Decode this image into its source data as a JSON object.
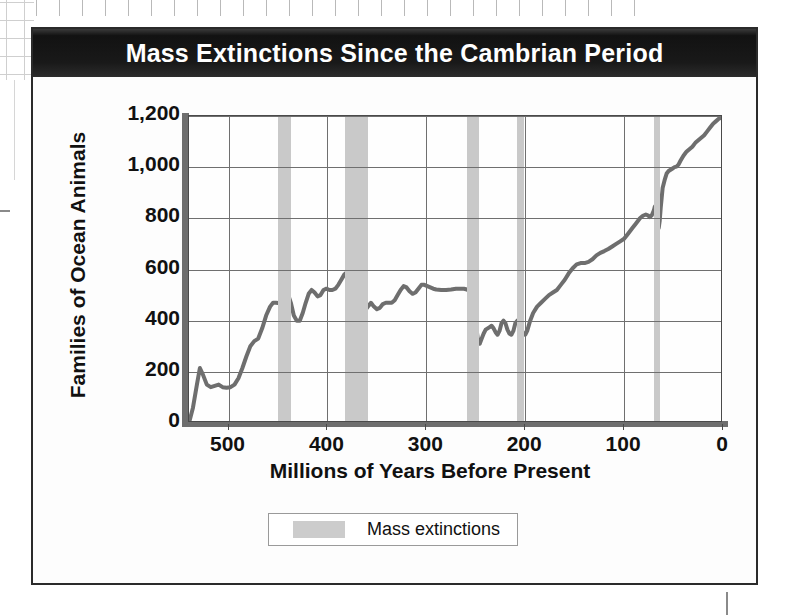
{
  "chart_data": {
    "type": "line",
    "title": "Mass Extinctions Since the Cambrian Period",
    "xlabel": "Millions of Years Before Present",
    "ylabel": "Families of Ocean Animals",
    "xlim": [
      540,
      0
    ],
    "ylim": [
      0,
      1200
    ],
    "x_reversed": true,
    "grid": true,
    "x_ticks": [
      "500",
      "400",
      "300",
      "200",
      "100",
      "0"
    ],
    "x_tick_values": [
      500,
      400,
      300,
      200,
      100,
      0
    ],
    "y_ticks": [
      "0",
      "200",
      "400",
      "600",
      "800",
      "1,000",
      "1,200"
    ],
    "y_tick_values": [
      0,
      200,
      400,
      600,
      800,
      1000,
      1200
    ],
    "legend": {
      "position": "bottom",
      "entries": [
        {
          "label": "Mass extinctions",
          "color": "#cccccc",
          "marker": "band"
        }
      ]
    },
    "series": [
      {
        "name": "Families of Ocean Animals",
        "color": "#6e6e6e",
        "points": [
          [
            540,
            0
          ],
          [
            536,
            60
          ],
          [
            532,
            150
          ],
          [
            529,
            215
          ],
          [
            526,
            190
          ],
          [
            522,
            150
          ],
          [
            518,
            140
          ],
          [
            514,
            145
          ],
          [
            510,
            150
          ],
          [
            506,
            140
          ],
          [
            502,
            138
          ],
          [
            498,
            140
          ],
          [
            494,
            150
          ],
          [
            490,
            175
          ],
          [
            486,
            215
          ],
          [
            482,
            260
          ],
          [
            478,
            300
          ],
          [
            474,
            320
          ],
          [
            470,
            330
          ],
          [
            466,
            370
          ],
          [
            462,
            420
          ],
          [
            458,
            455
          ],
          [
            455,
            470
          ],
          [
            452,
            470
          ],
          [
            448,
            468
          ],
          [
            445,
            472
          ],
          [
            442,
            500
          ],
          [
            440,
            505
          ],
          [
            437,
            470
          ],
          [
            434,
            420
          ],
          [
            431,
            400
          ],
          [
            428,
            400
          ],
          [
            425,
            430
          ],
          [
            422,
            470
          ],
          [
            419,
            505
          ],
          [
            416,
            520
          ],
          [
            413,
            510
          ],
          [
            410,
            495
          ],
          [
            407,
            500
          ],
          [
            404,
            520
          ],
          [
            401,
            525
          ],
          [
            398,
            520
          ],
          [
            395,
            520
          ],
          [
            392,
            525
          ],
          [
            389,
            540
          ],
          [
            386,
            560
          ],
          [
            383,
            580
          ],
          [
            380,
            590
          ],
          [
            377,
            585
          ],
          [
            374,
            560
          ],
          [
            371,
            520
          ],
          [
            368,
            490
          ],
          [
            365,
            470
          ],
          [
            362,
            440
          ],
          [
            359,
            455
          ],
          [
            356,
            470
          ],
          [
            353,
            455
          ],
          [
            350,
            445
          ],
          [
            347,
            450
          ],
          [
            344,
            465
          ],
          [
            341,
            470
          ],
          [
            338,
            470
          ],
          [
            335,
            470
          ],
          [
            332,
            480
          ],
          [
            329,
            500
          ],
          [
            326,
            520
          ],
          [
            323,
            535
          ],
          [
            320,
            530
          ],
          [
            317,
            515
          ],
          [
            314,
            505
          ],
          [
            311,
            510
          ],
          [
            308,
            525
          ],
          [
            305,
            540
          ],
          [
            302,
            540
          ],
          [
            299,
            535
          ],
          [
            296,
            530
          ],
          [
            293,
            525
          ],
          [
            290,
            522
          ],
          [
            285,
            520
          ],
          [
            280,
            520
          ],
          [
            275,
            522
          ],
          [
            270,
            525
          ],
          [
            265,
            525
          ],
          [
            262,
            525
          ],
          [
            259,
            522
          ],
          [
            256,
            515
          ],
          [
            254,
            500
          ],
          [
            252,
            470
          ],
          [
            251,
            430
          ],
          [
            250,
            395
          ],
          [
            249,
            360
          ],
          [
            248,
            330
          ],
          [
            247,
            315
          ],
          [
            246,
            310
          ],
          [
            244,
            330
          ],
          [
            242,
            350
          ],
          [
            240,
            365
          ],
          [
            238,
            370
          ],
          [
            236,
            375
          ],
          [
            234,
            380
          ],
          [
            232,
            370
          ],
          [
            230,
            355
          ],
          [
            228,
            345
          ],
          [
            226,
            360
          ],
          [
            224,
            390
          ],
          [
            222,
            400
          ],
          [
            220,
            390
          ],
          [
            218,
            365
          ],
          [
            216,
            350
          ],
          [
            214,
            345
          ],
          [
            212,
            360
          ],
          [
            210,
            390
          ],
          [
            208,
            400
          ],
          [
            206,
            395
          ],
          [
            204,
            370
          ],
          [
            202,
            350
          ],
          [
            200,
            345
          ],
          [
            198,
            360
          ],
          [
            195,
            400
          ],
          [
            192,
            430
          ],
          [
            188,
            455
          ],
          [
            184,
            470
          ],
          [
            180,
            485
          ],
          [
            176,
            500
          ],
          [
            172,
            510
          ],
          [
            168,
            520
          ],
          [
            164,
            540
          ],
          [
            160,
            560
          ],
          [
            156,
            585
          ],
          [
            152,
            605
          ],
          [
            148,
            620
          ],
          [
            144,
            625
          ],
          [
            140,
            625
          ],
          [
            136,
            630
          ],
          [
            132,
            640
          ],
          [
            128,
            655
          ],
          [
            124,
            665
          ],
          [
            120,
            672
          ],
          [
            116,
            680
          ],
          [
            112,
            690
          ],
          [
            108,
            700
          ],
          [
            104,
            710
          ],
          [
            100,
            720
          ],
          [
            96,
            740
          ],
          [
            92,
            760
          ],
          [
            88,
            780
          ],
          [
            84,
            800
          ],
          [
            81,
            810
          ],
          [
            78,
            815
          ],
          [
            76,
            812
          ],
          [
            74,
            805
          ],
          [
            72,
            812
          ],
          [
            70,
            830
          ],
          [
            69,
            845
          ],
          [
            68,
            850
          ],
          [
            67,
            830
          ],
          [
            66,
            790
          ],
          [
            65,
            762
          ],
          [
            64,
            790
          ],
          [
            63,
            840
          ],
          [
            62,
            880
          ],
          [
            61,
            920
          ],
          [
            59,
            950
          ],
          [
            57,
            975
          ],
          [
            55,
            985
          ],
          [
            53,
            990
          ],
          [
            51,
            995
          ],
          [
            49,
            1000
          ],
          [
            47,
            1002
          ],
          [
            45,
            1010
          ],
          [
            43,
            1025
          ],
          [
            40,
            1045
          ],
          [
            37,
            1060
          ],
          [
            34,
            1070
          ],
          [
            31,
            1080
          ],
          [
            28,
            1095
          ],
          [
            25,
            1105
          ],
          [
            22,
            1115
          ],
          [
            19,
            1125
          ],
          [
            16,
            1140
          ],
          [
            13,
            1155
          ],
          [
            10,
            1170
          ],
          [
            7,
            1180
          ],
          [
            4,
            1190
          ],
          [
            0,
            1195
          ]
        ]
      }
    ],
    "bands": [
      {
        "name": "End-Ordovician",
        "from": 450,
        "to": 437,
        "color": "#c9c9c9"
      },
      {
        "name": "Late Devonian",
        "from": 382,
        "to": 359,
        "color": "#c9c9c9"
      },
      {
        "name": "End-Permian",
        "from": 259,
        "to": 247,
        "color": "#c9c9c9"
      },
      {
        "name": "End-Triassic",
        "from": 208,
        "to": 201,
        "color": "#c9c9c9"
      },
      {
        "name": "End-Cretaceous",
        "from": 70,
        "to": 64,
        "color": "#c9c9c9"
      }
    ]
  },
  "legend": {
    "mass_extinctions_label": "Mass extinctions"
  },
  "colors": {
    "title_bar": "#1b1b1b",
    "title_text": "#ffffff",
    "line": "#6e6e6e",
    "band": "#c9c9c9",
    "grid": "#6f6f6f",
    "frame": "#2b2b2b"
  }
}
